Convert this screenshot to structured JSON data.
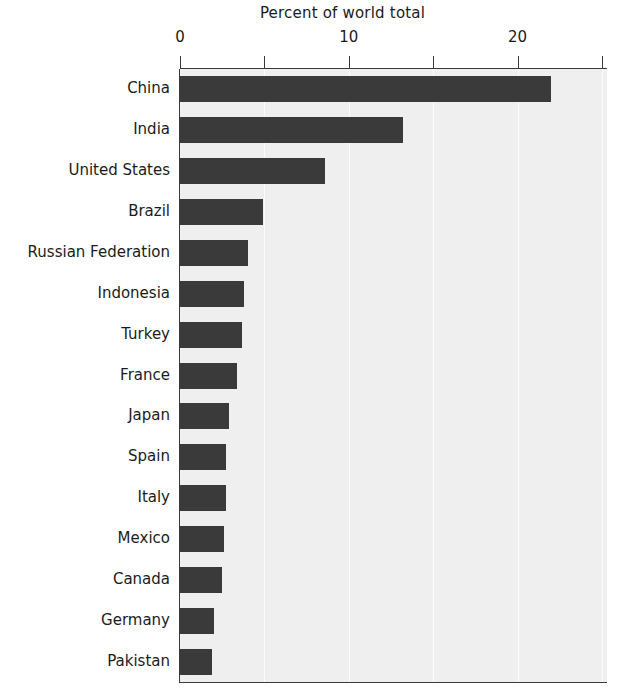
{
  "chart_data": {
    "type": "bar",
    "orientation": "horizontal",
    "title": "Percent of world total",
    "xlabel": "",
    "ylabel": "",
    "xlim": [
      0,
      25.3
    ],
    "xticks": [
      0,
      5,
      10,
      15,
      20,
      25
    ],
    "xtick_labels": [
      "0",
      "",
      "10",
      "",
      "20",
      ""
    ],
    "grid": true,
    "grid_axis": "x",
    "legend": false,
    "bar_color": "#3a3a3a",
    "plot_background": "#efefef",
    "figure_background": "#ffffff",
    "text_color": "#1b1b1b",
    "categories": [
      "China",
      "India",
      "United States",
      "Brazil",
      "Russian Federation",
      "Indonesia",
      "Turkey",
      "France",
      "Japan",
      "Spain",
      "Italy",
      "Mexico",
      "Canada",
      "Germany",
      "Pakistan"
    ],
    "values": [
      22.0,
      13.2,
      8.6,
      4.9,
      4.0,
      3.8,
      3.7,
      3.4,
      2.9,
      2.7,
      2.7,
      2.6,
      2.5,
      2.0,
      1.9
    ]
  }
}
